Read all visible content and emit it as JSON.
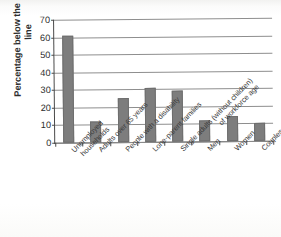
{
  "chart_data": {
    "type": "bar",
    "title": "",
    "xlabel": "",
    "ylabel": "Percentage below the poverty line",
    "ylim": [
      0,
      70
    ],
    "ytick_step": 10,
    "yticks": [
      "0",
      "10",
      "20",
      "30",
      "40",
      "50",
      "60",
      "70"
    ],
    "grid": true,
    "legend": "none",
    "bar_color": "#7d7d7d",
    "axis_color": "#4a4a4a",
    "grid_color": "#8e8e8e",
    "categories": [
      "Unemployed households",
      "Adults over 65 years",
      "People with a disability",
      "Lone-parent families",
      "Single adults (without children) of workforce age",
      "Men",
      "Women",
      "Couples with children"
    ],
    "category_lines": [
      [
        "Unemployed",
        "households"
      ],
      [
        "Adults over 65 years"
      ],
      [
        "People with a disability"
      ],
      [
        "Lone-parent families"
      ],
      [
        "Single adults (without children)",
        "of workforce age"
      ],
      [
        "Men"
      ],
      [
        "Women"
      ],
      [
        "Couples with children"
      ]
    ],
    "values": [
      61,
      12,
      25,
      31,
      29,
      12,
      14.5,
      10.5
    ]
  }
}
